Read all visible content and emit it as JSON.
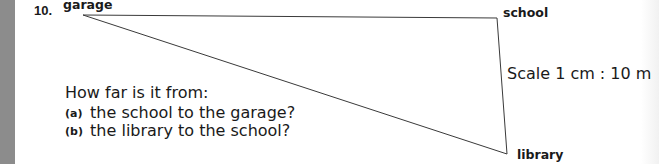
{
  "question": {
    "number": "10.",
    "places": {
      "garage": "garage",
      "school": "school",
      "library": "library"
    },
    "scale": "Scale 1 cm : 10 m",
    "prompt": "How far is it from:",
    "parts": [
      {
        "letter": "(a)",
        "text": "the school to the garage?"
      },
      {
        "letter": "(b)",
        "text": "the library to the school?"
      }
    ]
  },
  "colors": {
    "line": "#3a3a3a",
    "text": "#1a1a1a",
    "margin_strip": "#8c8c8c"
  }
}
